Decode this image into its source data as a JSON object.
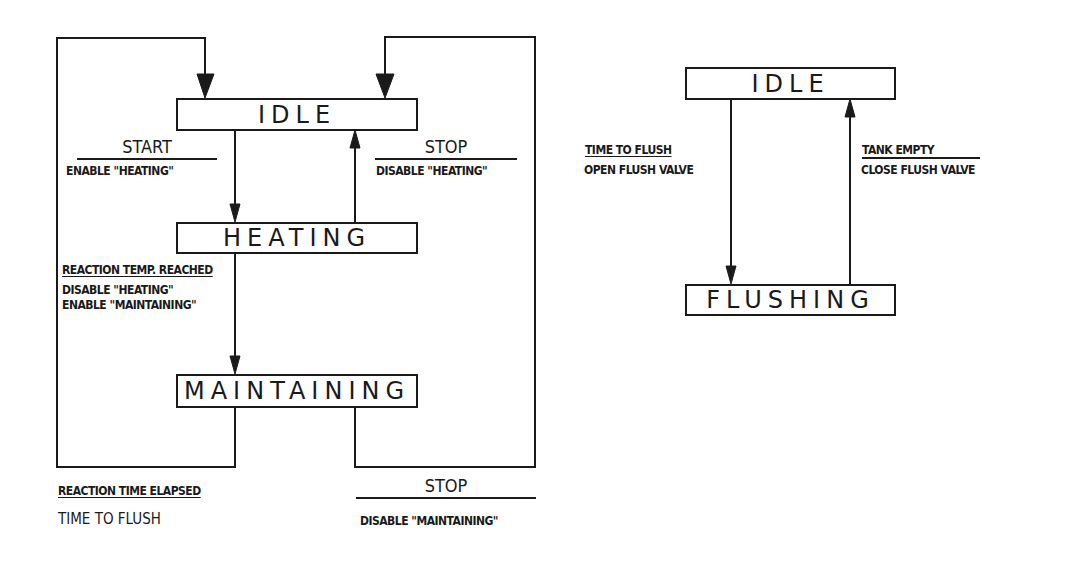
{
  "diagrams": {
    "reactor": {
      "states": {
        "idle": "IDLE",
        "heating": "HEATING",
        "maintaining": "MAINTAINING"
      },
      "transitions": {
        "start": {
          "event": "START",
          "action": "ENABLE \"HEATING\""
        },
        "stop_heating": {
          "event": "STOP",
          "action": "DISABLE \"HEATING\""
        },
        "reaction_temp": {
          "event": "REACTION TEMP. REACHED",
          "actions": [
            "DISABLE \"HEATING\"",
            "ENABLE \"MAINTAINING\""
          ]
        },
        "reaction_time": {
          "event": "REACTION TIME ELAPSED",
          "action": "TIME TO FLUSH"
        },
        "stop_maintaining": {
          "event": "STOP",
          "action": "DISABLE \"MAINTAINING\""
        }
      }
    },
    "flush": {
      "states": {
        "idle": "IDLE",
        "flushing": "FLUSHING"
      },
      "transitions": {
        "time_to_flush": {
          "event": "TIME TO FLUSH",
          "action": "OPEN FLUSH VALVE"
        },
        "tank_empty": {
          "event": "TANK EMPTY",
          "action": "CLOSE FLUSH VALVE"
        }
      }
    }
  },
  "colors": {
    "ink": "#1a1a1a",
    "background": "#ffffff"
  }
}
